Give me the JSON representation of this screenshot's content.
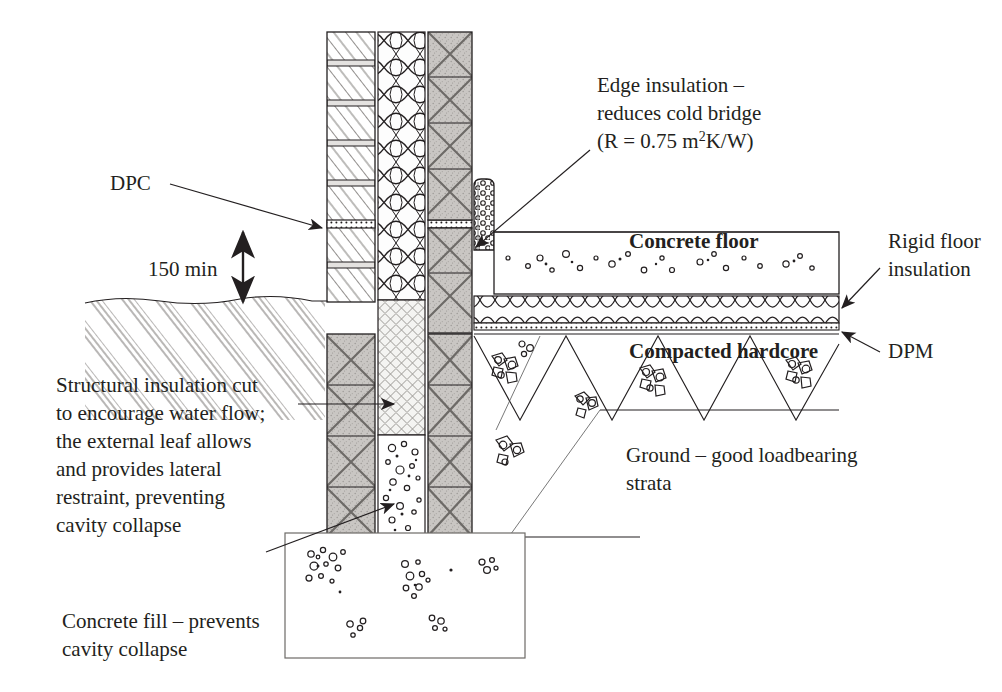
{
  "document": {
    "title": "Cavity wall / ground-bearing concrete floor junction detail",
    "type": "construction-section-drawing"
  },
  "colors": {
    "ink": "#231f20",
    "block_fill": "#c9c6c3",
    "hatch_line": "#6d6a67",
    "background": "#ffffff",
    "light_fill": "#efefef"
  },
  "labels": {
    "dpc": "DPC",
    "dimension_150": "150 min",
    "edge_insulation_line1": "Edge insulation –",
    "edge_insulation_line2": "reduces cold bridge",
    "edge_insulation_line3_a": "(R = 0.75 m",
    "edge_insulation_line3_sup": "2",
    "edge_insulation_line3_b": "K/W)",
    "concrete_floor": "Concrete floor",
    "rigid_floor_insulation_line1": "Rigid floor",
    "rigid_floor_insulation_line2": "insulation",
    "compacted_hardcore": "Compacted hardcore",
    "dpm": "DPM",
    "structural_insulation_line1": "Structural insulation cut",
    "structural_insulation_line2": "to encourage water flow;",
    "structural_insulation_line3": "the external leaf allows",
    "structural_insulation_line4": "and provides lateral",
    "structural_insulation_line5": "restraint, preventing",
    "structural_insulation_line6": "cavity collapse",
    "ground_line1": "Ground – good loadbearing",
    "ground_line2": "strata",
    "concrete_fill_line1": "Concrete fill – prevents",
    "concrete_fill_line2": "cavity collapse"
  },
  "annotations": {
    "dpc_note": "Damp proof course shown as dashed band in mortar course of outer leaf",
    "dimension_note": "Minimum height of DPC above finished ground level in millimetres"
  }
}
